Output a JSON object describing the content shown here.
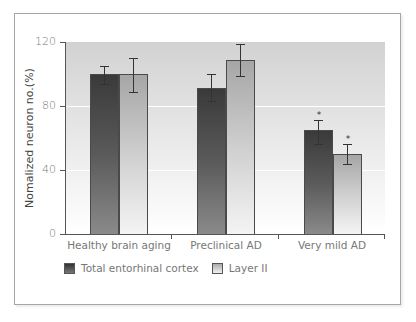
{
  "chart_data": {
    "type": "bar",
    "title": "",
    "xlabel": "",
    "ylabel": "Nomalized neuron no.(%)",
    "ylim": [
      0,
      120
    ],
    "yticks": [
      0,
      40,
      80,
      120
    ],
    "grid": true,
    "legend_position": "bottom",
    "categories": [
      "Healthy brain aging",
      "Preclinical AD",
      "Very mild AD"
    ],
    "series": [
      {
        "name": "Total entorhinal cortex",
        "color": "#4a4a4a",
        "values": [
          100,
          91,
          65
        ],
        "error_low": [
          94,
          83,
          56
        ],
        "error_high": [
          105,
          100,
          71
        ],
        "significant": [
          false,
          false,
          true
        ]
      },
      {
        "name": "Layer II",
        "color": "#cccccc",
        "values": [
          100,
          109,
          50
        ],
        "error_low": [
          89,
          99,
          44
        ],
        "error_high": [
          110,
          119,
          56
        ],
        "significant": [
          false,
          false,
          true
        ]
      }
    ],
    "annotations": [
      "*"
    ]
  },
  "labels": {
    "yaxis_title": "Nomalized neuron no.(%)",
    "yticks": [
      "0",
      "40",
      "80",
      "120"
    ],
    "categories": [
      "Healthy brain aging",
      "Preclinical AD",
      "Very mild AD"
    ],
    "legend": [
      "Total entorhinal cortex",
      "Layer II"
    ],
    "significance_marker": "*"
  }
}
